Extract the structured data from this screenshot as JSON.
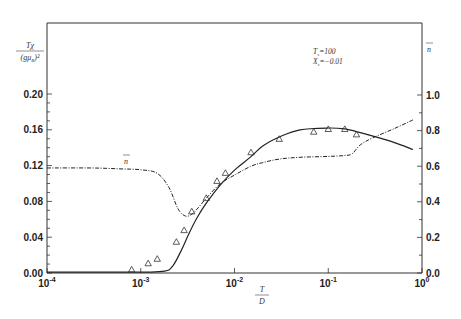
{
  "chart_data": {
    "type": "line",
    "title": "",
    "xlabel": "T/D",
    "ylabel_left": "Tχ/(gμB)²",
    "ylabel_right": "n̄",
    "xscale": "log",
    "xlim": [
      0.0001,
      1
    ],
    "ylim_left": [
      0,
      0.22
    ],
    "ylim_right": [
      0,
      1.1
    ],
    "x_ticks": [
      "10^-4",
      "10^-3",
      "10^-2",
      "10^-1",
      "10^0"
    ],
    "y_ticks_left": [
      "0.00",
      "0.04",
      "0.08",
      "0.12",
      "0.16",
      "0.20"
    ],
    "y_ticks_right": [
      "0.0",
      "0.2",
      "0.4",
      "0.6",
      "0.8",
      "1.0"
    ],
    "annotations": [
      {
        "text": "T_s=100",
        "position": "upper right"
      },
      {
        "text": "X_s=−0.01",
        "position": "upper right"
      },
      {
        "text": "n̄",
        "position": "near dash-dot curve, left"
      }
    ],
    "series": [
      {
        "name": "Tχ/(gμB)² (solid)",
        "axis": "left",
        "style": "solid",
        "x": [
          0.0001,
          0.001,
          0.0018,
          0.0022,
          0.0027,
          0.0033,
          0.004,
          0.005,
          0.007,
          0.01,
          0.015,
          0.02,
          0.03,
          0.05,
          0.1,
          0.15,
          0.2,
          0.3,
          0.5,
          0.8
        ],
        "values": [
          0.001,
          0.001,
          0.002,
          0.008,
          0.025,
          0.045,
          0.062,
          0.078,
          0.098,
          0.115,
          0.13,
          0.142,
          0.152,
          0.16,
          0.162,
          0.161,
          0.158,
          0.153,
          0.146,
          0.138
        ]
      },
      {
        "name": "n̄ (dash-dot)",
        "axis": "right",
        "style": "dash-dot",
        "x": [
          0.0001,
          0.0003,
          0.0006,
          0.001,
          0.0015,
          0.002,
          0.0025,
          0.003,
          0.0035,
          0.004,
          0.005,
          0.007,
          0.01,
          0.015,
          0.02,
          0.03,
          0.05,
          0.1,
          0.15,
          0.18,
          0.22,
          0.3,
          0.5,
          0.8
        ],
        "values": [
          0.59,
          0.59,
          0.585,
          0.58,
          0.56,
          0.48,
          0.36,
          0.32,
          0.33,
          0.36,
          0.42,
          0.5,
          0.55,
          0.6,
          0.62,
          0.64,
          0.65,
          0.655,
          0.66,
          0.67,
          0.72,
          0.76,
          0.81,
          0.86
        ]
      },
      {
        "name": "data (triangles)",
        "axis": "left",
        "style": "markers",
        "marker": "triangle-open",
        "x": [
          0.0008,
          0.0012,
          0.0015,
          0.0024,
          0.0029,
          0.0035,
          0.005,
          0.0065,
          0.008,
          0.015,
          0.03,
          0.07,
          0.1,
          0.15,
          0.2
        ],
        "values": [
          0.004,
          0.011,
          0.016,
          0.035,
          0.048,
          0.069,
          0.084,
          0.103,
          0.112,
          0.135,
          0.15,
          0.158,
          0.161,
          0.161,
          0.155
        ]
      }
    ]
  }
}
